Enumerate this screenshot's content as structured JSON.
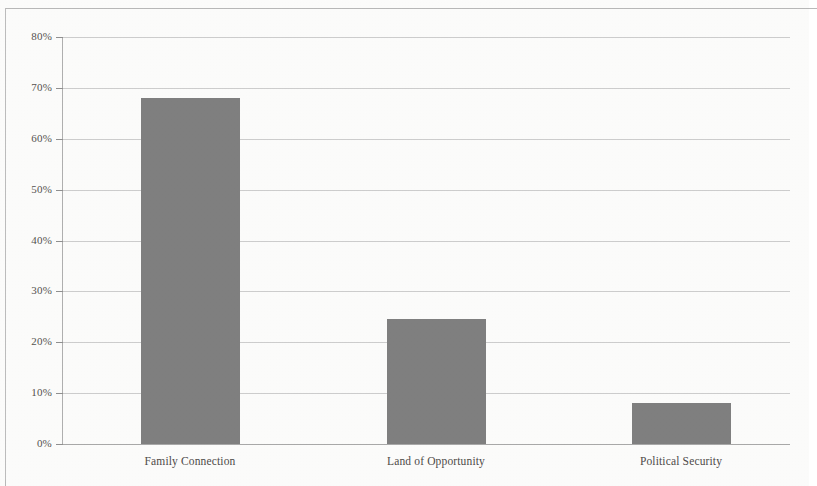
{
  "chart_data": {
    "type": "bar",
    "title": "",
    "subtitle": "",
    "xlabel": "",
    "ylabel": "",
    "categories": [
      "Family Connection",
      "Land of Opportunity",
      "Political Security"
    ],
    "values": [
      68,
      24.5,
      8
    ],
    "value_labels": [
      "68%",
      "24.5%",
      "8%"
    ],
    "series": [
      {
        "name": "",
        "values": [
          68,
          24.5,
          8
        ]
      }
    ],
    "ylim": [
      0,
      80
    ],
    "y_tick_labels": [
      "0%",
      "10%",
      "20%",
      "30%",
      "40%",
      "50%",
      "60%",
      "70%",
      "80%"
    ],
    "y_tick_values": [
      0,
      10,
      20,
      30,
      40,
      50,
      60,
      70,
      80
    ],
    "grid": true,
    "grid_axis": "y",
    "legend": false,
    "legend_position": "none",
    "bar_color": "#808080",
    "grid_color": "#c6c6c6",
    "axis_color": "#a9a9a9",
    "background_color": "#fdfdfc"
  }
}
